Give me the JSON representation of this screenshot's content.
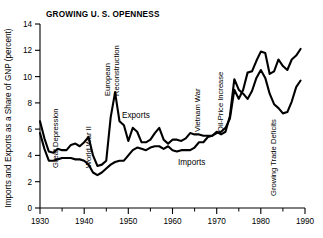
{
  "figure": {
    "title": "GROWING U. S. OPENNESS",
    "ylabel": "Imports and Exports as a Share of GNP (percent)"
  },
  "chart_data": {
    "type": "line",
    "title": "GROWING U. S. OPENNESS",
    "xlabel": "",
    "ylabel": "Imports and Exports as a Share of GNP (percent)",
    "xlim": [
      1930,
      1990
    ],
    "ylim": [
      0,
      14
    ],
    "xticks": [
      1930,
      1940,
      1950,
      1960,
      1970,
      1980,
      1990
    ],
    "xticks_minor": [
      1935,
      1945,
      1955,
      1965,
      1975,
      1985
    ],
    "yticks": [
      0,
      2,
      4,
      6,
      8,
      10,
      12,
      14
    ],
    "grid": false,
    "legend": "inline-annotations",
    "series": [
      {
        "name": "Exports",
        "x": [
          1930,
          1931,
          1932,
          1933,
          1934,
          1935,
          1936,
          1937,
          1938,
          1939,
          1940,
          1941,
          1942,
          1943,
          1944,
          1945,
          1946,
          1947,
          1948,
          1949,
          1950,
          1951,
          1952,
          1953,
          1954,
          1955,
          1956,
          1957,
          1958,
          1959,
          1960,
          1961,
          1962,
          1963,
          1964,
          1965,
          1966,
          1967,
          1968,
          1969,
          1970,
          1971,
          1972,
          1973,
          1974,
          1975,
          1976,
          1977,
          1978,
          1979,
          1980,
          1981,
          1982,
          1983,
          1984,
          1985,
          1986,
          1987,
          1988,
          1989
        ],
        "values": [
          6.6,
          5.3,
          4.3,
          4.2,
          4.5,
          4.4,
          4.4,
          4.8,
          4.9,
          4.7,
          5.0,
          5.4,
          4.0,
          3.2,
          3.3,
          3.6,
          6.9,
          8.8,
          6.6,
          6.3,
          5.1,
          6.1,
          5.8,
          5.0,
          5.0,
          5.2,
          5.7,
          6.1,
          5.2,
          4.9,
          5.2,
          5.2,
          5.1,
          5.3,
          5.7,
          5.6,
          5.6,
          5.5,
          5.5,
          5.5,
          5.8,
          5.6,
          5.8,
          7.0,
          9.8,
          9.0,
          8.7,
          8.3,
          8.9,
          9.9,
          10.5,
          9.9,
          8.7,
          7.9,
          7.6,
          7.2,
          7.3,
          8.1,
          9.2,
          9.7
        ]
      },
      {
        "name": "Imports",
        "x": [
          1930,
          1931,
          1932,
          1933,
          1934,
          1935,
          1936,
          1937,
          1938,
          1939,
          1940,
          1941,
          1942,
          1943,
          1944,
          1945,
          1946,
          1947,
          1948,
          1949,
          1950,
          1951,
          1952,
          1953,
          1954,
          1955,
          1956,
          1957,
          1958,
          1959,
          1960,
          1961,
          1962,
          1963,
          1964,
          1965,
          1966,
          1967,
          1968,
          1969,
          1970,
          1971,
          1972,
          1973,
          1974,
          1975,
          1976,
          1977,
          1978,
          1979,
          1980,
          1981,
          1982,
          1983,
          1984,
          1985,
          1986,
          1987,
          1988,
          1989
        ],
        "values": [
          5.7,
          4.5,
          3.6,
          3.6,
          3.7,
          3.8,
          3.8,
          3.8,
          3.7,
          3.7,
          3.6,
          3.3,
          2.7,
          2.5,
          2.7,
          3.0,
          3.3,
          3.5,
          3.6,
          3.6,
          4.0,
          4.4,
          4.6,
          4.5,
          4.4,
          4.6,
          4.7,
          4.7,
          4.5,
          4.7,
          4.4,
          4.3,
          4.4,
          4.4,
          4.4,
          4.6,
          5.0,
          5.0,
          5.4,
          5.5,
          5.7,
          5.8,
          6.1,
          6.8,
          9.0,
          8.3,
          9.0,
          10.3,
          10.4,
          11.2,
          11.9,
          11.8,
          10.2,
          10.4,
          11.3,
          10.8,
          10.5,
          11.3,
          11.6,
          12.1
        ]
      }
    ],
    "annotations": [
      {
        "text": "Great Depression",
        "orientation": "vertical"
      },
      {
        "text": "World War II",
        "orientation": "vertical"
      },
      {
        "text": "European Reconstruction",
        "orientation": "vertical"
      },
      {
        "text": "Exports",
        "orientation": "horizontal"
      },
      {
        "text": "Imports",
        "orientation": "horizontal"
      },
      {
        "text": "Vietnam War",
        "orientation": "vertical"
      },
      {
        "text": "Oil-Price Increase",
        "orientation": "vertical"
      },
      {
        "text": "Growing Trade Deficits",
        "orientation": "vertical"
      }
    ]
  },
  "annotations": {
    "great_depression": "Great Depression",
    "world_war_ii": "World War II",
    "european_reconstruction_l1": "European",
    "european_reconstruction_l2": "Reconstruction",
    "exports": "Exports",
    "imports": "Imports",
    "vietnam_war": "Vietnam War",
    "oil_price_increase": "Oil-Price Increase",
    "growing_trade_deficits": "Growing Trade Deficits"
  },
  "axes": {
    "yticks": [
      "0",
      "2",
      "4",
      "6",
      "8",
      "10",
      "12",
      "14"
    ],
    "xticks": [
      "1930",
      "1940",
      "1950",
      "1960",
      "1970",
      "1980",
      "1990"
    ]
  }
}
